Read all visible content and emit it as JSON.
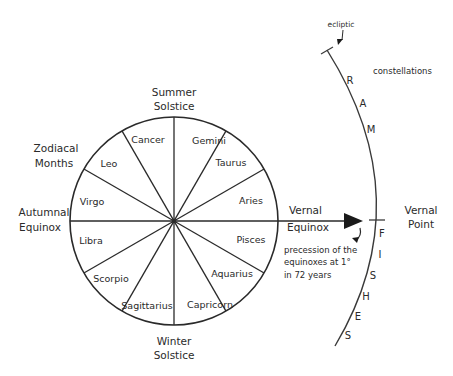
{
  "diagram": {
    "labels": {
      "summer_solstice": [
        "Summer",
        "Solstice"
      ],
      "winter_solstice": [
        "Winter",
        "Solstice"
      ],
      "autumnal_equinox": [
        "Autumnal",
        "Equinox"
      ],
      "vernal_equinox": [
        "Vernal",
        "Equinox"
      ],
      "zodiacal_months": [
        "Zodiacal",
        "Months"
      ],
      "vernal_point": [
        "Vernal",
        "Point"
      ],
      "ecliptic": "ecliptic",
      "constellations": "constellations",
      "precession_note": [
        "precession of the",
        "equinoxes at 1°",
        "in 72 years"
      ]
    },
    "zodiac_signs": [
      {
        "name": "Gemini",
        "x": 209,
        "y": 144
      },
      {
        "name": "Taurus",
        "x": 231,
        "y": 166
      },
      {
        "name": "Aries",
        "x": 251,
        "y": 204
      },
      {
        "name": "Pisces",
        "x": 251,
        "y": 243
      },
      {
        "name": "Aquarius",
        "x": 232,
        "y": 277
      },
      {
        "name": "Capricorn",
        "x": 210,
        "y": 308
      },
      {
        "name": "Sagittarius",
        "x": 147,
        "y": 309
      },
      {
        "name": "Scorpio",
        "x": 111,
        "y": 282
      },
      {
        "name": "Libra",
        "x": 91,
        "y": 244
      },
      {
        "name": "Virgo",
        "x": 92,
        "y": 205
      },
      {
        "name": "Leo",
        "x": 109,
        "y": 167
      },
      {
        "name": "Cancer",
        "x": 148,
        "y": 143
      }
    ],
    "ecliptic_letters": [
      {
        "char": "R",
        "x": 350,
        "y": 84
      },
      {
        "char": "A",
        "x": 363,
        "y": 107
      },
      {
        "char": "M",
        "x": 371,
        "y": 133
      },
      {
        "char": "F",
        "x": 382,
        "y": 237
      },
      {
        "char": "I",
        "x": 380,
        "y": 258
      },
      {
        "char": "S",
        "x": 373,
        "y": 279
      },
      {
        "char": "H",
        "x": 366,
        "y": 300
      },
      {
        "char": "E",
        "x": 358,
        "y": 320
      },
      {
        "char": "S",
        "x": 348,
        "y": 339
      }
    ],
    "colors": {
      "stroke": "#2a2a2a",
      "background": "#ffffff"
    }
  }
}
